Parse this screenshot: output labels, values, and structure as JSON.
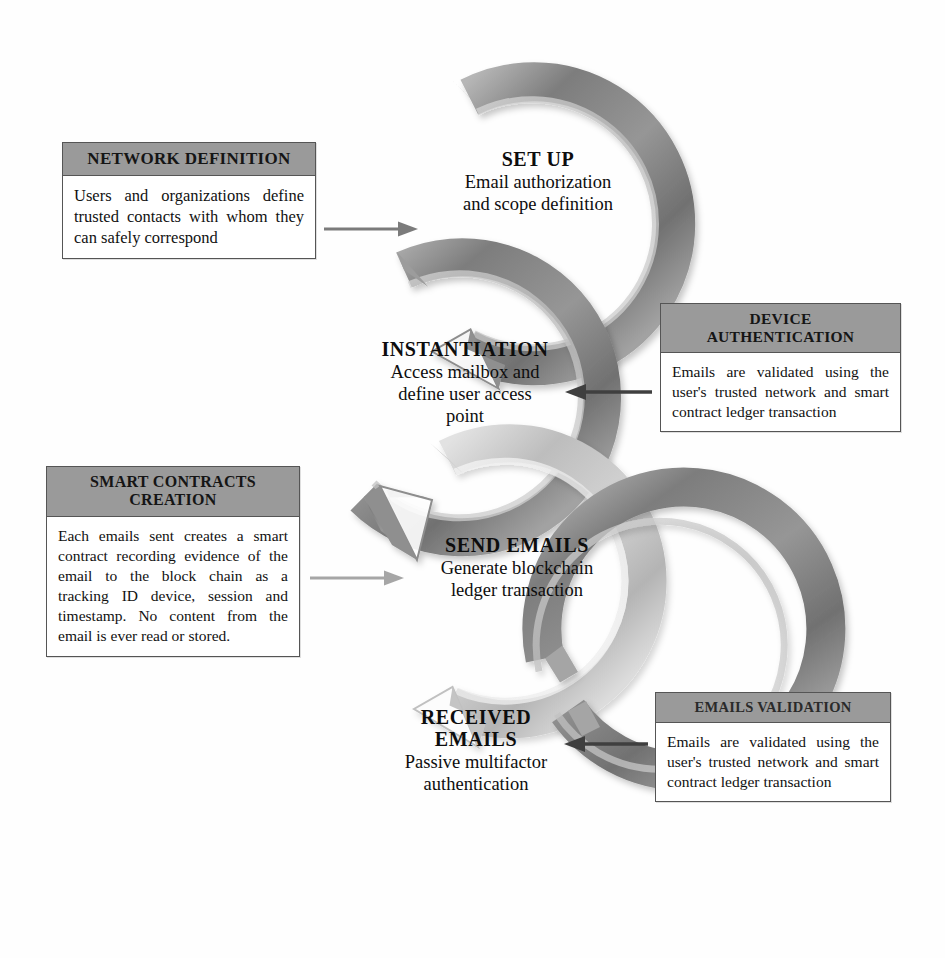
{
  "diagram": {
    "type": "cycle-flow",
    "colors": {
      "ring_dark": "#8a8a8a",
      "ring_light": "#c9c9c9",
      "box_header": "#9a9a9a",
      "box_border": "#555555",
      "text": "#111111",
      "background": "#fefefe"
    }
  },
  "stages": [
    {
      "id": "set-up",
      "title": "SET UP",
      "description": "Email authorization and scope definition",
      "desc_line1": "Email authorization",
      "desc_line2": "and scope definition",
      "ring_tone": "dark"
    },
    {
      "id": "instantiation",
      "title": "INSTANTIATION",
      "description": "Access mailbox and define user access point",
      "desc_line1": "Access mailbox and",
      "desc_line2": "define user access",
      "desc_line3": "point",
      "ring_tone": "dark"
    },
    {
      "id": "send-emails",
      "title": "SEND EMAILS",
      "description": "Generate blockchain ledger transaction",
      "desc_line1": "Generate blockchain",
      "desc_line2": "ledger transaction",
      "ring_tone": "light"
    },
    {
      "id": "received-emails",
      "title_line1": "RECEIVED",
      "title_line2": "EMAILS",
      "title": "RECEIVED EMAILS",
      "description": "Passive multifactor authentication",
      "desc_line1": "Passive multifactor",
      "desc_line2": "authentication",
      "ring_tone": "dark"
    }
  ],
  "boxes": [
    {
      "id": "network-definition",
      "header": "NETWORK DEFINITION",
      "body": "Users and organizations define trusted contacts with whom they can safely correspond",
      "side": "left",
      "connects_to": "set-up"
    },
    {
      "id": "device-authentication",
      "header_line1": "DEVICE",
      "header_line2": "AUTHENTICATION",
      "header": "DEVICE AUTHENTICATION",
      "body": "Emails are validated using the user's trusted network and smart contract ledger transaction",
      "side": "right",
      "connects_to": "instantiation"
    },
    {
      "id": "smart-contracts-creation",
      "header_line1": "SMART CONTRACTS",
      "header_line2": "CREATION",
      "header": "SMART CONTRACTS CREATION",
      "body": "Each emails sent creates a smart contract recording evidence of the email to the block chain as a tracking ID device, session and timestamp. No content from the email is ever read or stored.",
      "side": "left",
      "connects_to": "send-emails"
    },
    {
      "id": "emails-validation",
      "header": "EMAILS VALIDATION",
      "body": "Emails are validated using the user's trusted network and smart contract ledger transaction",
      "side": "right",
      "connects_to": "received-emails"
    }
  ],
  "connectors": [
    {
      "id": "connector-network-to-setup",
      "from": "network-definition",
      "to": "set-up",
      "direction": "right",
      "tone": "dark"
    },
    {
      "id": "connector-device-to-instantiation",
      "from": "device-authentication",
      "to": "instantiation",
      "direction": "left",
      "tone": "dark"
    },
    {
      "id": "connector-smart-to-send",
      "from": "smart-contracts-creation",
      "to": "send-emails",
      "direction": "right",
      "tone": "light"
    },
    {
      "id": "connector-validation-to-received",
      "from": "emails-validation",
      "to": "received-emails",
      "direction": "left",
      "tone": "dark"
    }
  ]
}
